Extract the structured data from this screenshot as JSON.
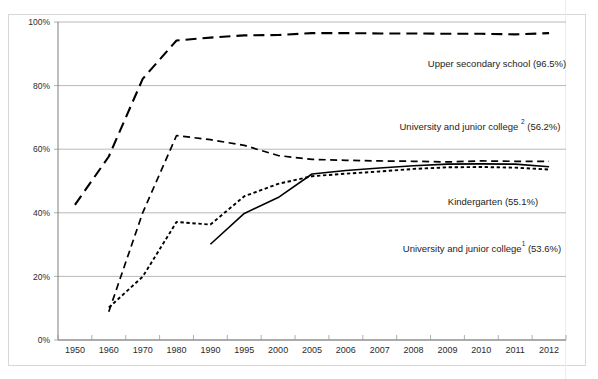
{
  "chart_data": {
    "type": "line",
    "title": "",
    "subtitle": "",
    "xlabel": "",
    "ylabel": "",
    "grid": true,
    "legend_position": "inline-annotations",
    "ylim": [
      0,
      100
    ],
    "yticks": [
      "0%",
      "20%",
      "40%",
      "60%",
      "80%",
      "100%"
    ],
    "ytick_values": [
      0,
      20,
      40,
      60,
      80,
      100
    ],
    "categories": [
      "1950",
      "1960",
      "1970",
      "1980",
      "1990",
      "1995",
      "2000",
      "2005",
      "2006",
      "2007",
      "2008",
      "2009",
      "2010",
      "2011",
      "2012"
    ],
    "series": [
      {
        "name": "Upper secondary school",
        "final_value_label": "96.5%",
        "annotation": "Upper secondary school (96.5%)",
        "style": "long-dash",
        "dash": "11,6",
        "width": 2.1,
        "x": [
          "1950",
          "1960",
          "1970",
          "1980",
          "1990",
          "1995",
          "2000",
          "2005",
          "2006",
          "2007",
          "2008",
          "2009",
          "2010",
          "2011",
          "2012"
        ],
        "values": [
          42.5,
          57.7,
          82.1,
          94.2,
          95.1,
          95.8,
          95.9,
          96.5,
          96.5,
          96.4,
          96.4,
          96.3,
          96.3,
          96.1,
          96.5
        ]
      },
      {
        "name": "University and junior college 2",
        "final_value_label": "56.2%",
        "annotation": "University and junior college ² (56.2%)",
        "style": "medium-dash",
        "dash": "7,4.5",
        "width": 1.7,
        "x": [
          "1960",
          "1970",
          "1980",
          "1990",
          "1995",
          "2000",
          "2005",
          "2006",
          "2007",
          "2008",
          "2009",
          "2010",
          "2011",
          "2012"
        ],
        "values": [
          8.9,
          40.0,
          64.3,
          63.0,
          61.2,
          58.0,
          56.8,
          56.5,
          56.3,
          56.2,
          56.0,
          56.3,
          56.2,
          56.2
        ]
      },
      {
        "name": "University and junior college 1",
        "final_value_label": "53.6%",
        "annotation": "University and junior college¹ (53.6%)",
        "style": "dotted-dash",
        "dash": "3.4,2.6",
        "width": 1.9,
        "x": [
          "1960",
          "1970",
          "1980",
          "1990",
          "1995",
          "2000",
          "2005",
          "2006",
          "2007",
          "2008",
          "2009",
          "2010",
          "2011",
          "2012"
        ],
        "values": [
          10.2,
          19.9,
          37.1,
          36.3,
          45.2,
          49.1,
          51.5,
          52.3,
          53.0,
          53.8,
          54.3,
          54.4,
          54.2,
          53.6
        ]
      },
      {
        "name": "Kindergarten",
        "final_value_label": "55.1%",
        "annotation": "Kindergarten  (55.1%)",
        "style": "solid",
        "dash": "none",
        "width": 1.6,
        "x": [
          "1990",
          "1995",
          "2000",
          "2005",
          "2006",
          "2007",
          "2008",
          "2009",
          "2010",
          "2011",
          "2012"
        ],
        "values": [
          30.1,
          39.8,
          44.8,
          52.2,
          53.3,
          54.1,
          54.8,
          55.3,
          55.4,
          55.3,
          54.5
        ]
      }
    ],
    "annotations": [
      {
        "text": "Upper secondary school (96.5%)",
        "x_px": 497,
        "y_px": 67
      },
      {
        "text": "University and junior college ² (56.2%)",
        "x_px": 480,
        "y_px": 130
      },
      {
        "text": "Kindergarten  (55.1%)",
        "x_px": 493,
        "y_px": 205
      },
      {
        "text": "University and junior college¹ (53.6%)",
        "x_px": 482,
        "y_px": 252
      }
    ]
  },
  "colors": {
    "line": "#000000",
    "grid": "#a6a6a6",
    "axis": "#7d7d7d",
    "frame": "#d8d8d8",
    "text": "#1d1d1d",
    "background": "#ffffff"
  }
}
